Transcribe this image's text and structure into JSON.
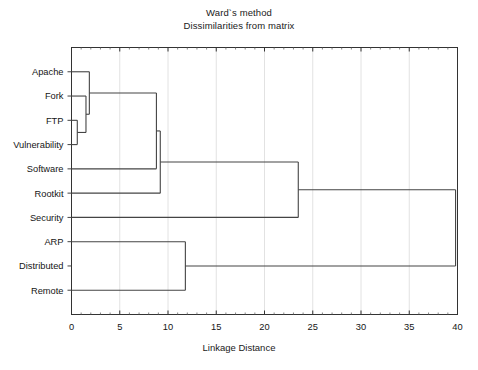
{
  "titles": {
    "line1": "Ward`s method",
    "line2": "Dissimilarities from matrix"
  },
  "axis": {
    "xlabel": "Linkage Distance",
    "ticks": [
      "0",
      "5",
      "10",
      "15",
      "20",
      "25",
      "30",
      "35",
      "40"
    ]
  },
  "leaves": [
    {
      "label": "Apache"
    },
    {
      "label": "Fork"
    },
    {
      "label": "FTP"
    },
    {
      "label": "Vulnerability"
    },
    {
      "label": "Software"
    },
    {
      "label": "Rootkit"
    },
    {
      "label": "Security"
    },
    {
      "label": "ARP"
    },
    {
      "label": "Distributed"
    },
    {
      "label": "Remote"
    }
  ],
  "colors": {
    "line": "#444444",
    "frame": "#333333",
    "grid": "#e2e2e2",
    "text": "#151515",
    "background": "#ffffff"
  },
  "chart_data": {
    "type": "line",
    "subtype": "dendrogram",
    "title": "Ward`s method",
    "subtitle": "Dissimilarities from matrix",
    "xlabel": "Linkage Distance",
    "ylabel": "",
    "xlim": [
      0,
      40
    ],
    "xticks": [
      0,
      5,
      10,
      15,
      20,
      25,
      30,
      35,
      40
    ],
    "grid": true,
    "orientation": "horizontal",
    "leaf_order": [
      "Apache",
      "Fork",
      "FTP",
      "Vulnerability",
      "Software",
      "Rootkit",
      "Security",
      "ARP",
      "Distributed",
      "Remote"
    ],
    "merges": [
      {
        "id": "m1",
        "left": "FTP",
        "right": "Vulnerability",
        "distance": 0.6
      },
      {
        "id": "m2",
        "left": "Fork",
        "right": "m1",
        "distance": 1.5
      },
      {
        "id": "m3",
        "left": "Apache",
        "right": "m2",
        "distance": 1.85
      },
      {
        "id": "m4",
        "left": "m3",
        "right": "Software",
        "distance": 8.8
      },
      {
        "id": "m5",
        "left": "m4",
        "right": "Rootkit",
        "distance": 9.2
      },
      {
        "id": "m6",
        "left": "ARP",
        "right": "Remote",
        "distance": 11.8
      },
      {
        "id": "m7",
        "left": "m5",
        "right": "Security",
        "distance": 23.5
      },
      {
        "id": "m8",
        "left": "m7",
        "right": "m6",
        "distance": 39.8
      }
    ]
  }
}
